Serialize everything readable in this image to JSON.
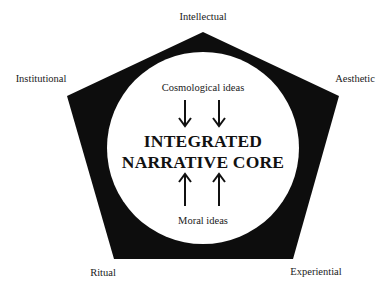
{
  "diagram": {
    "type": "pentagon-with-inner-circle",
    "dimensions": [
      "Intellectual",
      "Aesthetic",
      "Experiential",
      "Ritual",
      "Institutional"
    ],
    "outer_labels": {
      "top": "Intellectual",
      "upper_left": "Institutional",
      "upper_right": "Aesthetic",
      "lower_left": "Ritual",
      "lower_right": "Experiential"
    },
    "core": {
      "line1": "INTEGRATED",
      "line2": "NARRATIVE CORE"
    },
    "inputs": {
      "top": {
        "label": "Cosmological ideas",
        "arrow_direction": "down",
        "arrow_count": 2
      },
      "bottom": {
        "label": "Moral ideas",
        "arrow_direction": "up",
        "arrow_count": 2
      }
    },
    "colors": {
      "pentagon_fill": "#0d0d0d",
      "circle_fill": "#ffffff",
      "text": "#1a1a1a",
      "background": "#ffffff"
    }
  }
}
